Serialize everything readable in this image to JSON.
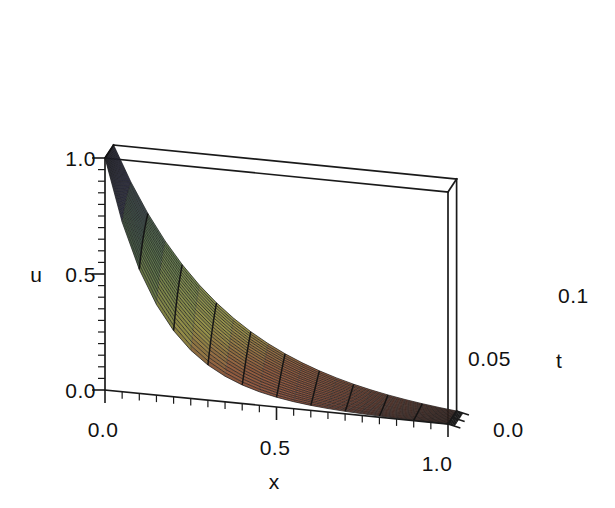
{
  "figure": {
    "kind": "surface-plot-3d",
    "background_color": "#ffffff",
    "frame_color": "#1a1a1a"
  },
  "axes": {
    "x": {
      "name": "x",
      "ticks": [
        "0.0",
        "0.5",
        "1.0"
      ],
      "tick_values": [
        0.0,
        0.5,
        1.0
      ],
      "range": [
        0.0,
        1.0
      ]
    },
    "t": {
      "name": "t",
      "ticks": [
        "0.0",
        "0.05",
        "0.1"
      ],
      "tick_values": [
        0.0,
        0.05,
        0.1
      ],
      "range": [
        0.0,
        0.1
      ]
    },
    "u": {
      "name": "u",
      "ticks": [
        "0.0",
        "0.5",
        "1.0"
      ],
      "tick_values": [
        0.0,
        0.5,
        1.0
      ],
      "range": [
        0.0,
        1.0
      ]
    }
  },
  "chart_data": {
    "type": "surface",
    "title": "",
    "xlabel": "x",
    "ylabel": "t",
    "zlabel": "u",
    "xlim": [
      0.0,
      1.0
    ],
    "ylim": [
      0.0,
      0.1
    ],
    "zlim": [
      0.0,
      1.0
    ],
    "grid": false,
    "legend": "none",
    "x": [
      0.0,
      0.05,
      0.1,
      0.15,
      0.2,
      0.25,
      0.3,
      0.35,
      0.4,
      0.45,
      0.5,
      0.55,
      0.6,
      0.65,
      0.7,
      0.75,
      0.8,
      0.85,
      0.9,
      0.95,
      1.0
    ],
    "t": [
      0.0,
      0.005,
      0.01,
      0.015,
      0.02,
      0.025,
      0.03,
      0.035,
      0.04,
      0.045,
      0.05,
      0.055,
      0.06,
      0.065,
      0.07,
      0.075,
      0.08,
      0.085,
      0.09,
      0.095,
      0.1
    ],
    "surface_formula": "u(x,t) = exp(-x/(0.16+1.6*t)) decaying boundary-layer profile",
    "z_at_t_min": [
      1.0,
      0.73,
      0.53,
      0.39,
      0.29,
      0.21,
      0.15,
      0.11,
      0.08,
      0.06,
      0.04,
      0.03,
      0.023,
      0.017,
      0.012,
      0.009,
      0.006,
      0.005,
      0.003,
      0.002,
      0.0
    ],
    "z_at_t_mid": [
      1.0,
      0.81,
      0.66,
      0.54,
      0.44,
      0.36,
      0.29,
      0.24,
      0.19,
      0.16,
      0.13,
      0.1,
      0.08,
      0.07,
      0.05,
      0.04,
      0.03,
      0.025,
      0.02,
      0.015,
      0.0
    ],
    "z_at_t_max": [
      1.0,
      0.85,
      0.73,
      0.62,
      0.53,
      0.45,
      0.39,
      0.33,
      0.28,
      0.24,
      0.2,
      0.17,
      0.15,
      0.12,
      0.11,
      0.09,
      0.08,
      0.06,
      0.05,
      0.04,
      0.0
    ],
    "colormap": "height-based terrain: dark blue-violet (high u) to green (mid u) to olive-yellow then red-brown (low u)",
    "color_stops": [
      "#474380",
      "#5a5f8a",
      "#6f8f5c",
      "#8f9b55",
      "#a09a4e",
      "#8a6447",
      "#8c5344"
    ]
  },
  "view": {
    "projection": "perspective-box",
    "box_corners_px": {
      "back_top_left": [
        188,
        28
      ],
      "back_top_right": [
        534,
        62
      ],
      "front_top_left": [
        105,
        158
      ],
      "front_top_right": [
        448,
        192
      ],
      "front_bottom_left": [
        105,
        390
      ],
      "front_bottom_right": [
        448,
        424
      ],
      "right_bottom_back": [
        534,
        294
      ]
    }
  }
}
